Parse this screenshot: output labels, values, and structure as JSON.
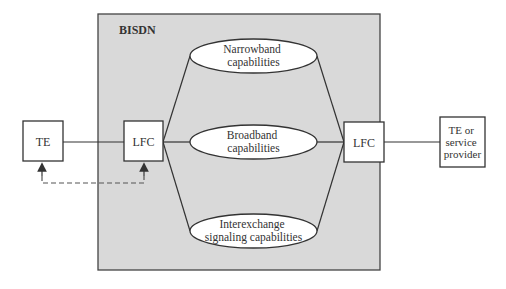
{
  "diagram": {
    "container": {
      "label": "BISDN",
      "fill": "#d9d9d9"
    },
    "left_terminal": {
      "label": "TE"
    },
    "left_lfc": {
      "label": "LFC"
    },
    "right_lfc": {
      "label": "LFC"
    },
    "right_terminal": {
      "lines": [
        "TE or",
        "service",
        "provider"
      ]
    },
    "capabilities": [
      {
        "lines": [
          "Narrowband",
          "capabilities"
        ]
      },
      {
        "lines": [
          "Broadband",
          "capabilities"
        ]
      },
      {
        "lines": [
          "Interexchange",
          "signaling capabilities"
        ]
      }
    ],
    "dashed_link": {
      "from": "TE",
      "to": "LFC",
      "style": "dashed-arrows"
    }
  }
}
